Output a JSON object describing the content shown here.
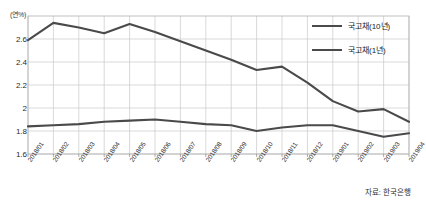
{
  "chart_data": {
    "type": "line",
    "title": "",
    "xlabel": "",
    "ylabel": "",
    "unit_label": "(연%)",
    "ylim": [
      1.6,
      2.8
    ],
    "ytick_labels": [
      "2.6",
      "2.4",
      "2.2",
      "2",
      "1.8",
      "1.6"
    ],
    "ytick_values": [
      2.6,
      2.4,
      2.2,
      2.0,
      1.8,
      1.6
    ],
    "grid": true,
    "legend_position": "top-right",
    "categories": [
      "2018/01",
      "2018/02",
      "2018/03",
      "2018/04",
      "2018/05",
      "2018/06",
      "2018/07",
      "2018/08",
      "2018/09",
      "2018/10",
      "2018/11",
      "2018/12",
      "2019/01",
      "2019/02",
      "2019/03",
      "2019/04"
    ],
    "series": [
      {
        "name": "국고채(10년)",
        "color": "#4a4a4a",
        "values": [
          2.59,
          2.74,
          2.7,
          2.65,
          2.73,
          2.66,
          2.58,
          2.5,
          2.42,
          2.33,
          2.36,
          2.22,
          2.06,
          1.97,
          1.99,
          1.88
        ]
      },
      {
        "name": "국고채(1년)",
        "color": "#4a4a4a",
        "values": [
          1.84,
          1.85,
          1.86,
          1.88,
          1.89,
          1.9,
          1.88,
          1.86,
          1.85,
          1.8,
          1.83,
          1.85,
          1.85,
          1.8,
          1.75,
          1.78
        ]
      }
    ]
  },
  "source": {
    "note": "자료: 한국은행"
  }
}
